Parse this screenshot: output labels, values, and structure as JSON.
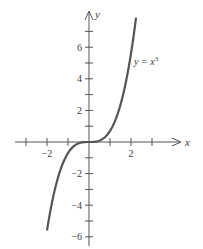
{
  "chart_data": {
    "type": "line",
    "title": "",
    "xlabel": "x",
    "ylabel": "y",
    "xlim": [
      -3.5,
      4.2
    ],
    "ylim": [
      -6.5,
      8.2
    ],
    "grid": false,
    "legend": null,
    "x_ticks": [
      -3,
      -2,
      -1,
      0,
      1,
      2,
      3
    ],
    "x_tick_labels": [
      {
        "value": -2,
        "text": "−2"
      },
      {
        "value": 2,
        "text": "2"
      }
    ],
    "y_ticks": [
      -6,
      -5,
      -4,
      -3,
      -2,
      -1,
      0,
      1,
      2,
      3,
      4,
      5,
      6,
      7
    ],
    "y_tick_labels": [
      {
        "value": 6,
        "text": "6"
      },
      {
        "value": 4,
        "text": "4"
      },
      {
        "value": 2,
        "text": "2"
      },
      {
        "value": -2,
        "text": "−2"
      },
      {
        "value": -4,
        "text": "−4"
      },
      {
        "value": -6,
        "text": "−6"
      }
    ],
    "series": [
      {
        "name": "y = x^3",
        "function": "x^3",
        "x": [
          -2,
          -1.5,
          -1,
          -0.5,
          0,
          0.5,
          1,
          1.5,
          2
        ],
        "values": [
          -8,
          -3.375,
          -1,
          -0.125,
          0,
          0.125,
          1,
          3.375,
          8
        ]
      }
    ],
    "annotations": [
      {
        "text": "y = x",
        "superscript": "3",
        "near": {
          "x": 1.6,
          "y": 5
        }
      }
    ]
  },
  "labels": {
    "x_axis": "x",
    "y_axis": "y",
    "curve_main": "y = x",
    "curve_exp": "3"
  }
}
